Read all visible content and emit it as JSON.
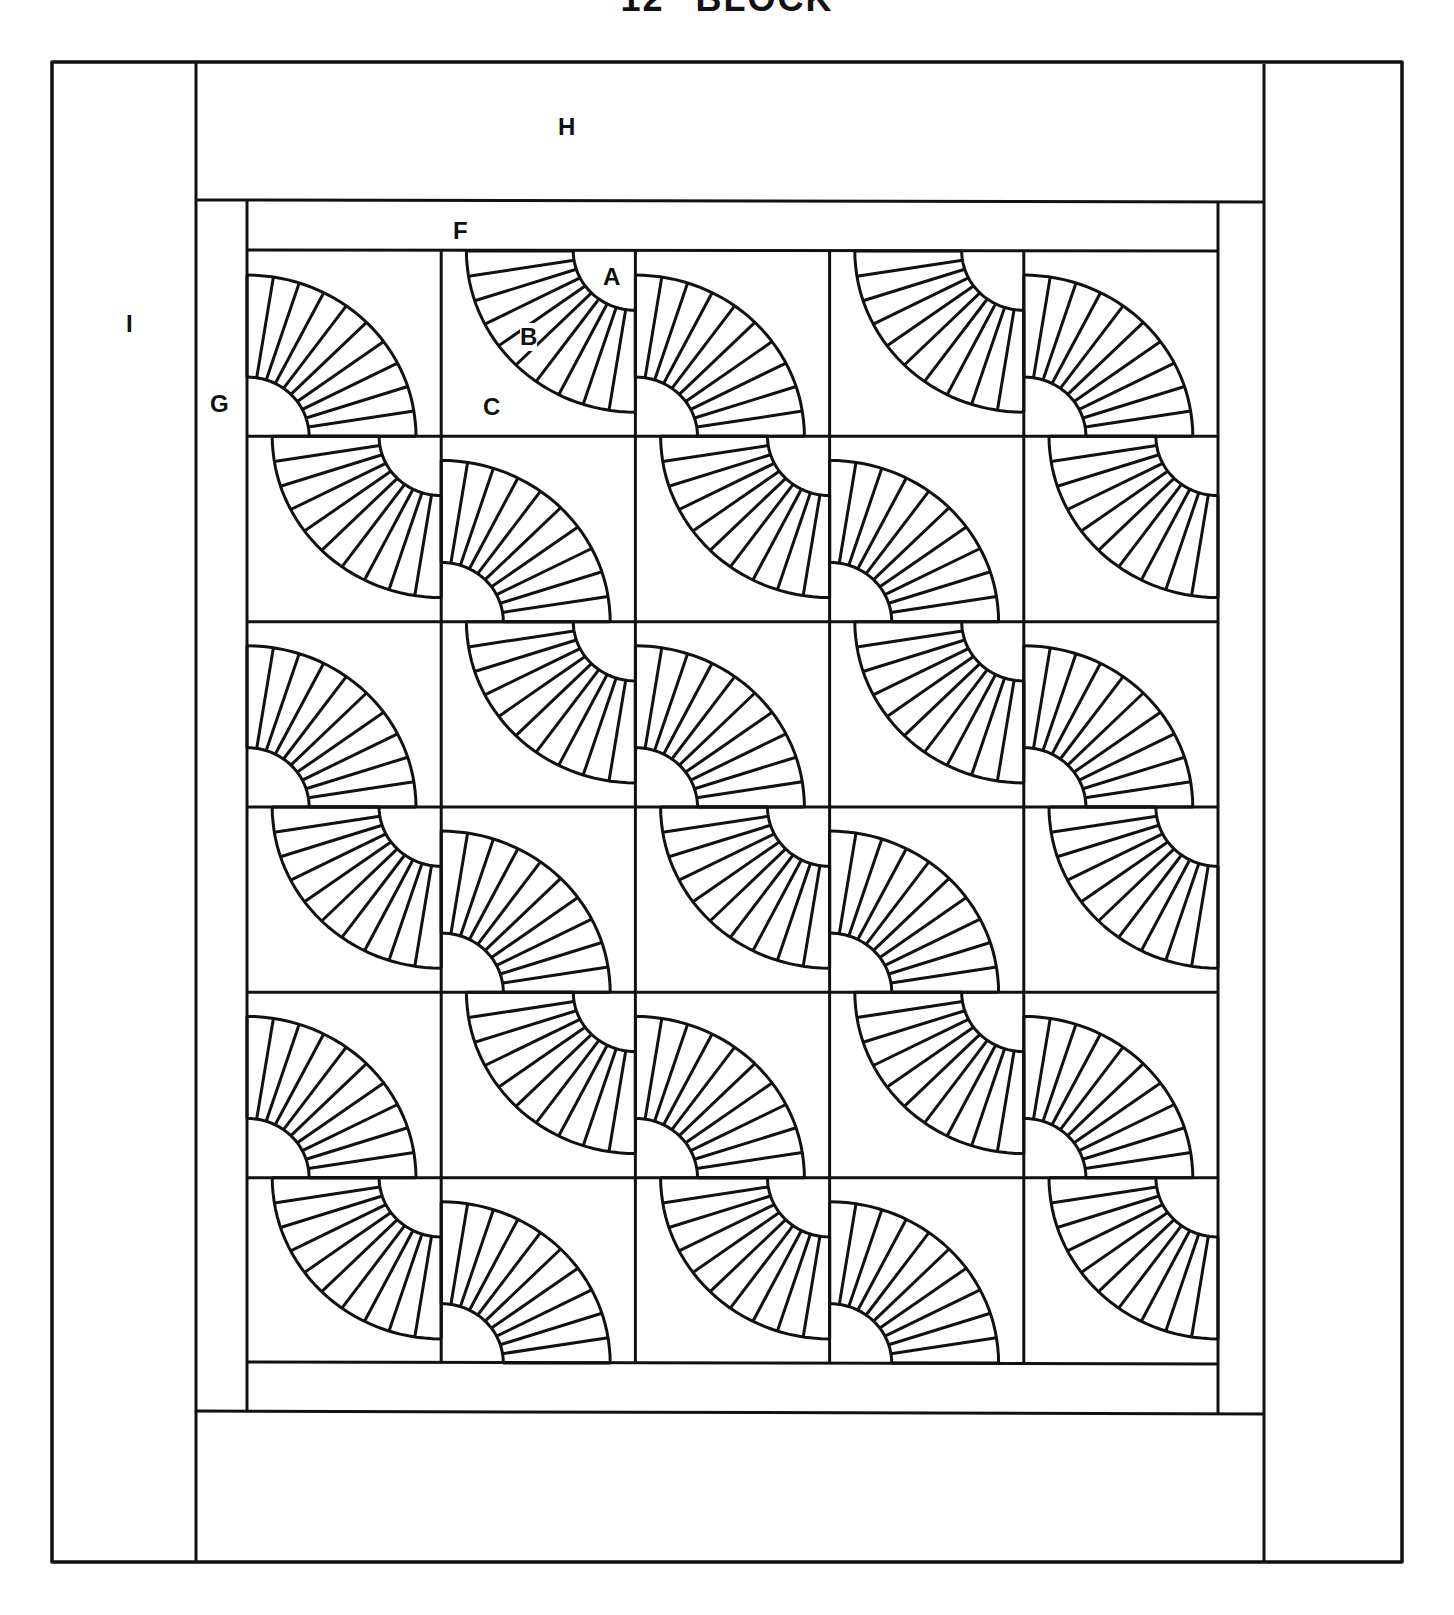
{
  "title": "12\" BLOCK",
  "colors": {
    "line": "#111111",
    "background": "#ffffff"
  },
  "labels": {
    "A": "A",
    "B": "B",
    "C": "C",
    "F": "F",
    "G": "G",
    "H": "H",
    "I": "I"
  },
  "diagram": {
    "type": "quilt-layout",
    "grid": {
      "rows": 6,
      "cols": 5
    },
    "pattern": "checkerboard fan blocks: even cells fan anchored bottom-left, odd cells fan anchored top-right",
    "fan_segments": 10,
    "borders": [
      {
        "label": "F",
        "description": "inner top/bottom strip"
      },
      {
        "label": "G",
        "description": "inner side strips"
      },
      {
        "label": "H",
        "description": "outer top/bottom border"
      },
      {
        "label": "I",
        "description": "outer side borders"
      }
    ],
    "block_pieces": [
      {
        "label": "A",
        "description": "quarter circle corner"
      },
      {
        "label": "B",
        "description": "fan blade arc"
      },
      {
        "label": "C",
        "description": "background"
      }
    ]
  }
}
